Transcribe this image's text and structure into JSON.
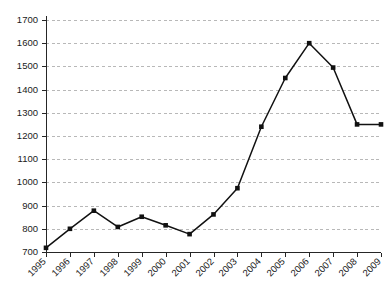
{
  "chart_data": {
    "type": "line",
    "title": "",
    "subtitle": "",
    "xlabel": "",
    "ylabel": "",
    "categories": [
      "1995",
      "1996",
      "1997",
      "1998",
      "1999",
      "2000",
      "2001",
      "2002",
      "2003",
      "2004",
      "2005",
      "2006",
      "2007",
      "2008",
      "2009"
    ],
    "values": [
      718,
      800,
      878,
      808,
      852,
      815,
      777,
      862,
      975,
      1240,
      1450,
      1600,
      1495,
      1250,
      1250
    ],
    "series": [
      {
        "name": "series-1",
        "values": [
          718,
          800,
          878,
          808,
          852,
          815,
          777,
          862,
          975,
          1240,
          1450,
          1600,
          1495,
          1250,
          1250
        ]
      }
    ],
    "ylim": [
      700,
      1700
    ],
    "ytick_labels": [
      "700",
      "800",
      "900",
      "1000",
      "1100",
      "1200",
      "1300",
      "1400",
      "1500",
      "1600",
      "1700"
    ],
    "ytick_values": [
      700,
      800,
      900,
      1000,
      1100,
      1200,
      1300,
      1400,
      1500,
      1600,
      1700
    ],
    "xtick_labels": [
      "1995",
      "1996",
      "1997",
      "1998",
      "1999",
      "2000",
      "2001",
      "2002",
      "2003",
      "2004",
      "2005",
      "2006",
      "2007",
      "2008",
      "2009"
    ],
    "grid": true,
    "grid_axis": "y",
    "grid_style": "dashed",
    "legend": false,
    "legend_position": "none",
    "marker": "square",
    "line_color": "#111111",
    "marker_color": "#111111",
    "grid_color": "#b8b8b8",
    "axis_color": "#262626",
    "background_color": "#ffffff",
    "xlabel_rotation": -45
  },
  "layout": {
    "plot_left": 46,
    "plot_right": 381,
    "plot_top": 20,
    "plot_bottom": 252
  }
}
